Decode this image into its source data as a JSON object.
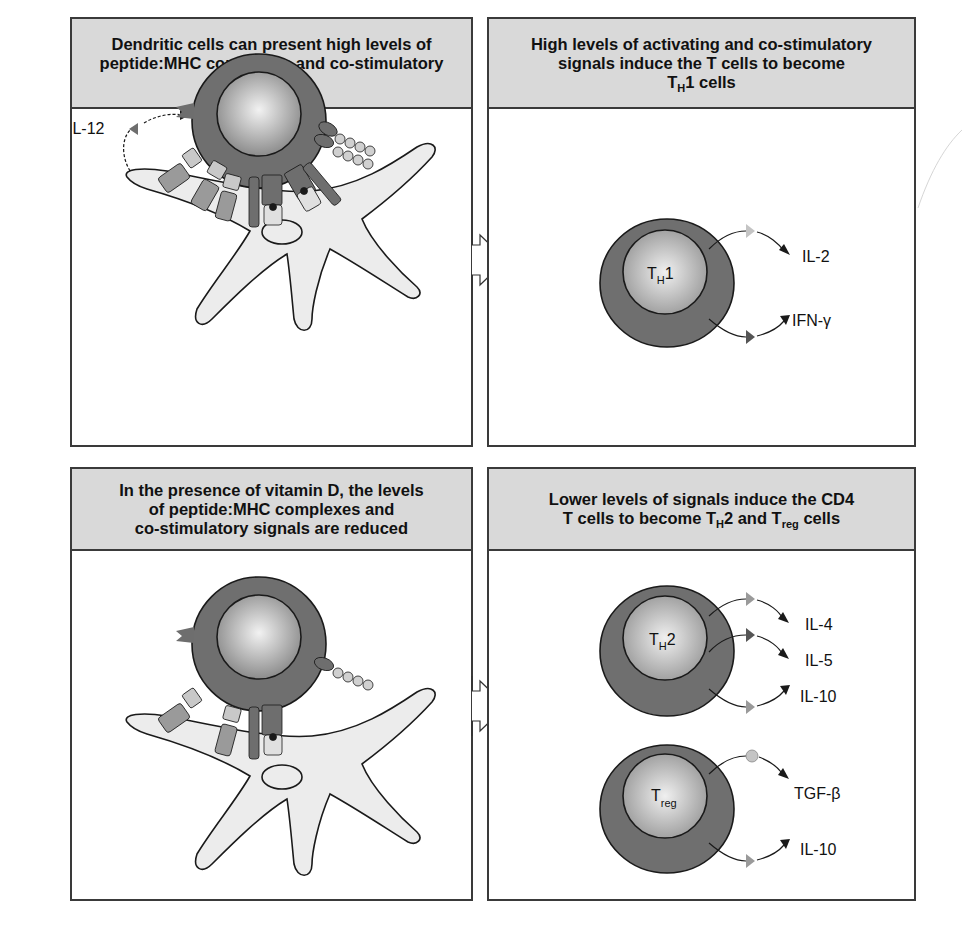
{
  "panels": {
    "top_left": {
      "title_lines": [
        "Dendritic cells can present high levels of",
        "peptide:MHC complexes and co-stimulatory",
        "signals"
      ],
      "labels": {
        "cytokine": "IL-12"
      }
    },
    "top_right": {
      "title_lines": [
        "High levels of activating and co-stimulatory",
        "signals induce the T cells to become"
      ],
      "title_line3": {
        "base": "T",
        "sub": "H",
        "rest": "1 cells"
      },
      "cell": {
        "base": "T",
        "sub": "H",
        "rest": "1"
      },
      "cytokines": [
        "IL-2",
        "IFN-γ"
      ]
    },
    "bottom_left": {
      "title_lines": [
        "In the presence of vitamin D, the levels",
        "of peptide:MHC complexes and",
        "co-stimulatory signals are reduced"
      ]
    },
    "bottom_right": {
      "title_line1": "Lower levels of signals induce the CD4",
      "title_line2": {
        "pre": "T cells to become T",
        "sub1": "H",
        "mid": "2 and T",
        "sub2": "reg",
        "post": " cells"
      },
      "th2_cell": {
        "base": "T",
        "sub": "H",
        "rest": "2"
      },
      "th2_cytokines": [
        "IL-4",
        "IL-5",
        "IL-10"
      ],
      "treg_cell": {
        "base": "T",
        "sub": "reg"
      },
      "treg_cytokines": [
        "TGF-β",
        "IL-10"
      ]
    }
  },
  "colors": {
    "header_bg": "#d9d9d9",
    "border": "#3a3a3a",
    "cell_outer": "#6f6f6f",
    "cell_inner_light": "#e6e6e6",
    "dendritic_cell": "#ececec",
    "receptor_dark": "#6e6e6e",
    "receptor_mid": "#9a9a9a",
    "receptor_light": "#c8c8c8"
  }
}
